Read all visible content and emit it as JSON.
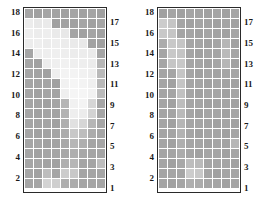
{
  "figure": {
    "background_color": "#ffffff",
    "border_color": "#2a2a2a",
    "gridline_color": "#ffffff"
  },
  "chart_data": [
    {
      "id": "left-heatmap",
      "type": "heatmap",
      "title": "",
      "subtitle": "",
      "xlabel": "",
      "ylabel": "",
      "grid": true,
      "legend": "none",
      "n_rows": 18,
      "n_cols": 9,
      "x": [
        1,
        2,
        3,
        4,
        5,
        6,
        7,
        8,
        9
      ],
      "row_labels_top_to_bottom": [
        18,
        17,
        16,
        15,
        14,
        13,
        12,
        11,
        10,
        9,
        8,
        7,
        6,
        5,
        4,
        3,
        2,
        1
      ],
      "left_axis_ticks": [
        "18",
        "",
        "16",
        "",
        "14",
        "",
        "12",
        "",
        "10",
        "",
        "8",
        "",
        "6",
        "",
        "4",
        "",
        "2",
        ""
      ],
      "right_axis_ticks": [
        "",
        "17",
        "",
        "15",
        "",
        "13",
        "",
        "11",
        "",
        "9",
        "",
        "7",
        "",
        "5",
        "",
        "3",
        "",
        "1"
      ],
      "colorscale": "grayscale",
      "value_range": [
        0,
        1
      ],
      "values": [
        [
          0.52,
          0.5,
          0.52,
          0.51,
          0.5,
          0.52,
          0.5,
          0.52,
          0.5
        ],
        [
          0.92,
          0.9,
          0.91,
          0.5,
          0.51,
          0.5,
          0.52,
          0.5,
          0.52
        ],
        [
          0.93,
          0.92,
          0.93,
          0.91,
          0.9,
          0.52,
          0.5,
          0.52,
          0.5
        ],
        [
          0.92,
          0.93,
          0.92,
          0.93,
          0.92,
          0.91,
          0.9,
          0.51,
          0.5
        ],
        [
          0.52,
          0.92,
          0.93,
          0.94,
          0.93,
          0.92,
          0.92,
          0.91,
          0.52
        ],
        [
          0.52,
          0.5,
          0.92,
          0.94,
          0.95,
          0.94,
          0.93,
          0.92,
          0.62
        ],
        [
          0.52,
          0.51,
          0.5,
          0.93,
          0.96,
          0.96,
          0.95,
          0.93,
          0.64
        ],
        [
          0.52,
          0.51,
          0.52,
          0.5,
          0.95,
          0.97,
          0.96,
          0.94,
          0.63
        ],
        [
          0.52,
          0.5,
          0.52,
          0.51,
          0.94,
          0.97,
          0.97,
          0.95,
          0.64
        ],
        [
          0.52,
          0.51,
          0.5,
          0.52,
          0.62,
          0.95,
          0.96,
          0.8,
          0.52
        ],
        [
          0.52,
          0.5,
          0.52,
          0.51,
          0.6,
          0.93,
          0.92,
          0.78,
          0.52
        ],
        [
          0.52,
          0.51,
          0.52,
          0.5,
          0.58,
          0.86,
          0.8,
          0.62,
          0.52
        ],
        [
          0.52,
          0.5,
          0.51,
          0.52,
          0.56,
          0.72,
          0.66,
          0.56,
          0.52
        ],
        [
          0.52,
          0.52,
          0.5,
          0.51,
          0.54,
          0.62,
          0.58,
          0.52,
          0.52
        ],
        [
          0.52,
          0.5,
          0.52,
          0.52,
          0.54,
          0.58,
          0.54,
          0.52,
          0.52
        ],
        [
          0.52,
          0.52,
          0.51,
          0.5,
          0.58,
          0.62,
          0.52,
          0.52,
          0.66
        ],
        [
          0.52,
          0.5,
          0.66,
          0.52,
          0.74,
          0.72,
          0.52,
          0.52,
          0.52
        ],
        [
          0.52,
          0.52,
          0.78,
          0.76,
          0.58,
          0.56,
          0.52,
          0.52,
          0.52
        ]
      ]
    },
    {
      "id": "right-heatmap",
      "type": "heatmap",
      "title": "",
      "subtitle": "",
      "xlabel": "",
      "ylabel": "",
      "grid": true,
      "legend": "none",
      "n_rows": 18,
      "n_cols": 9,
      "x": [
        1,
        2,
        3,
        4,
        5,
        6,
        7,
        8,
        9
      ],
      "row_labels_top_to_bottom": [
        18,
        17,
        16,
        15,
        14,
        13,
        12,
        11,
        10,
        9,
        8,
        7,
        6,
        5,
        4,
        3,
        2,
        1
      ],
      "left_axis_ticks": [
        "18",
        "",
        "16",
        "",
        "14",
        "",
        "12",
        "",
        "10",
        "",
        "8",
        "",
        "6",
        "",
        "4",
        "",
        "2",
        ""
      ],
      "right_axis_ticks": [
        "",
        "17",
        "",
        "15",
        "",
        "13",
        "",
        "11",
        "",
        "9",
        "",
        "7",
        "",
        "5",
        "",
        "3",
        "",
        "1"
      ],
      "colorscale": "grayscale",
      "value_range": [
        0,
        1
      ],
      "values": [
        [
          0.5,
          0.52,
          0.5,
          0.52,
          0.51,
          0.5,
          0.52,
          0.5,
          0.52
        ],
        [
          0.74,
          0.7,
          0.52,
          0.5,
          0.52,
          0.51,
          0.5,
          0.52,
          0.5
        ],
        [
          0.72,
          0.7,
          0.52,
          0.52,
          0.5,
          0.52,
          0.51,
          0.5,
          0.52
        ],
        [
          0.56,
          0.72,
          0.7,
          0.52,
          0.52,
          0.5,
          0.52,
          0.62,
          0.5
        ],
        [
          0.52,
          0.72,
          0.7,
          0.52,
          0.5,
          0.52,
          0.52,
          0.64,
          0.52
        ],
        [
          0.52,
          0.7,
          0.72,
          0.52,
          0.52,
          0.5,
          0.52,
          0.62,
          0.5
        ],
        [
          0.52,
          0.52,
          0.7,
          0.52,
          0.5,
          0.52,
          0.51,
          0.52,
          0.52
        ],
        [
          0.52,
          0.5,
          0.7,
          0.52,
          0.52,
          0.5,
          0.52,
          0.51,
          0.5
        ],
        [
          0.52,
          0.52,
          0.68,
          0.52,
          0.5,
          0.52,
          0.52,
          0.5,
          0.52
        ],
        [
          0.52,
          0.5,
          0.66,
          0.52,
          0.52,
          0.5,
          0.51,
          0.52,
          0.5
        ],
        [
          0.52,
          0.52,
          0.64,
          0.52,
          0.5,
          0.52,
          0.52,
          0.5,
          0.52
        ],
        [
          0.52,
          0.5,
          0.62,
          0.52,
          0.52,
          0.51,
          0.5,
          0.52,
          0.5
        ],
        [
          0.52,
          0.52,
          0.6,
          0.52,
          0.5,
          0.52,
          0.52,
          0.5,
          0.52
        ],
        [
          0.52,
          0.5,
          0.58,
          0.52,
          0.52,
          0.5,
          0.52,
          0.51,
          0.62
        ],
        [
          0.52,
          0.52,
          0.56,
          0.52,
          0.5,
          0.52,
          0.52,
          0.5,
          0.52
        ],
        [
          0.52,
          0.5,
          0.54,
          0.66,
          0.64,
          0.52,
          0.52,
          0.52,
          0.5
        ],
        [
          0.52,
          0.52,
          0.52,
          0.74,
          0.72,
          0.52,
          0.5,
          0.52,
          0.52
        ],
        [
          0.52,
          0.5,
          0.52,
          0.58,
          0.56,
          0.52,
          0.52,
          0.5,
          0.52
        ]
      ]
    }
  ]
}
